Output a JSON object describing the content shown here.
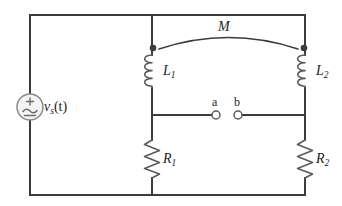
{
  "figure": {
    "kind": "circuit-diagram",
    "background_color": "#ffffff",
    "wire_color": "#3c3c3c",
    "component_color": "#5a5a5a",
    "label_color": "#1d1d1d"
  },
  "labels": {
    "source": "v",
    "source_sub": "s",
    "source_arg": "(t)",
    "inductor1": "L",
    "inductor1_sub": "1",
    "inductor2": "L",
    "inductor2_sub": "2",
    "resistor1": "R",
    "resistor1_sub": "1",
    "resistor2": "R",
    "resistor2_sub": "2",
    "mutual": "M",
    "terminal_a": "a",
    "terminal_b": "b"
  },
  "components": {
    "source": {
      "name": "ac-voltage-source",
      "polarity_plus": "+",
      "waveform": "sine"
    },
    "inductor1": {
      "name": "inductor-L1",
      "turns": 4,
      "dot_marked": true
    },
    "inductor2": {
      "name": "inductor-L2",
      "turns": 4,
      "dot_marked": true
    },
    "resistor1": {
      "name": "resistor-R1",
      "zigzags": 6
    },
    "resistor2": {
      "name": "resistor-R2",
      "zigzags": 6
    },
    "coupling": {
      "name": "mutual-inductance-arc"
    },
    "terminal_a": {
      "name": "terminal-a",
      "open": true
    },
    "terminal_b": {
      "name": "terminal-b",
      "open": true
    }
  }
}
